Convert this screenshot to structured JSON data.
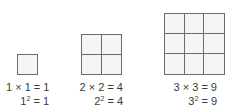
{
  "figures": [
    {
      "n": 1,
      "product": "1 × 1 = 1",
      "base": "1",
      "exp": "2",
      "rest": " = 1"
    },
    {
      "n": 2,
      "product": "2 × 2 = 4",
      "base": "2",
      "exp": "2",
      "rest": " = 4"
    },
    {
      "n": 3,
      "product": "3 × 3 = 9",
      "base": "3",
      "exp": "2",
      "rest": " = 9"
    }
  ],
  "colors": {
    "line": "#6b6b6b",
    "fill": "#f4f4f4",
    "text": "#3a3a3a"
  }
}
